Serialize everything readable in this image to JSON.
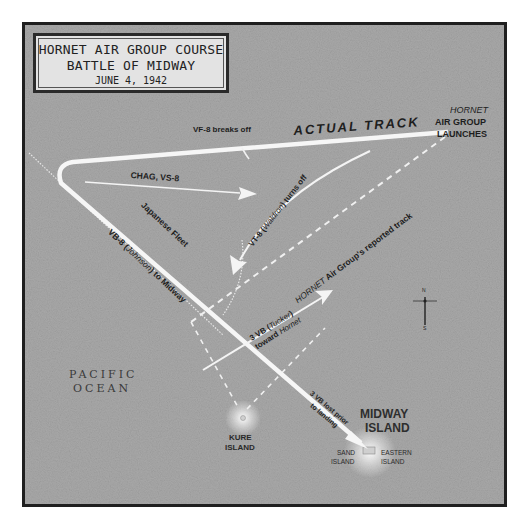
{
  "title": {
    "line1": "HORNET AIR GROUP COURSE",
    "line2": "BATTLE OF MIDWAY",
    "date": "JUNE 4, 1942"
  },
  "labels": {
    "hornet": "HORNET",
    "air_group": "AIR GROUP",
    "launches": "LAUNCHES",
    "actual_track": "ACTUAL TRACK",
    "vf8": "VF-8 breaks off",
    "chag": "CHAG, VS-8",
    "vt8_prefix": "VT-8 (",
    "vt8_name": "Waldron",
    "vt8_suffix": ") turns off",
    "reported_hornet": "HORNET",
    "reported_rest": " Air Group's reported track",
    "japanese_fleet": "Japanese Fleet",
    "vb8_prefix": "VB-8 (",
    "vb8_name": "Johnson",
    "vb8_suffix": ") to Midway",
    "tucker_line1_prefix": "3 VB (",
    "tucker_name": "Tucker",
    "tucker_line1_suffix": ")",
    "tucker_line2_prefix": "toward ",
    "tucker_line2_ship": "Hornet",
    "lost_line1": "3 VB lost prior",
    "lost_line2": "to landing",
    "pacific": "PACIFIC",
    "ocean": "OCEAN",
    "kure1": "KURE",
    "kure2": "ISLAND",
    "midway1": "MIDWAY",
    "midway2": "ISLAND",
    "sand1": "SAND",
    "sand2": "ISLAND",
    "eastern1": "EASTERN",
    "eastern2": "ISLAND",
    "compass_n": "N",
    "compass_s": "S"
  },
  "colors": {
    "ocean": "#a9a9a9",
    "track": "#f4f4f4",
    "frame": "#1f1f1f",
    "text": "#1e1e1e"
  }
}
